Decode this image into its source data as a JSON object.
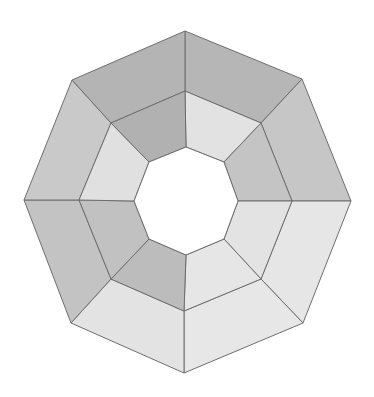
{
  "diagram": {
    "title": "",
    "shape": "segmented-octagonal-ring",
    "rings": 2,
    "segments_per_ring": 8,
    "stroke_color": "#6e6e6e",
    "background": "#ffffff",
    "vertices": {
      "outer": [
        [
          185,
          31
        ],
        [
          302,
          79
        ],
        [
          351,
          201
        ],
        [
          303,
          323
        ],
        [
          184,
          373
        ],
        [
          71,
          323
        ],
        [
          24,
          200
        ],
        [
          72,
          80
        ]
      ],
      "middle": [
        [
          185,
          91
        ],
        [
          261,
          123
        ],
        [
          292,
          201
        ],
        [
          261,
          279
        ],
        [
          184,
          311
        ],
        [
          111,
          279
        ],
        [
          79,
          200
        ],
        [
          111,
          123
        ]
      ],
      "inner": [
        [
          186,
          147
        ],
        [
          224,
          162
        ],
        [
          238,
          201
        ],
        [
          224,
          239
        ],
        [
          186,
          255
        ],
        [
          149,
          239
        ],
        [
          134,
          201
        ],
        [
          149,
          162
        ]
      ]
    },
    "segments": {
      "outer": [
        {
          "position": "top-right",
          "fill": "#b6b6b6"
        },
        {
          "position": "right-upper",
          "fill": "#c6c6c6"
        },
        {
          "position": "right-lower",
          "fill": "#e6e6e6"
        },
        {
          "position": "bottom-right",
          "fill": "#e7e7e7"
        },
        {
          "position": "bottom-left",
          "fill": "#e3e3e3"
        },
        {
          "position": "left-lower",
          "fill": "#c3c3c3"
        },
        {
          "position": "left-upper",
          "fill": "#c9c9c9"
        },
        {
          "position": "top-left",
          "fill": "#b4b4b4"
        }
      ],
      "inner": [
        {
          "position": "top-right",
          "fill": "#e2e2e2"
        },
        {
          "position": "right-upper",
          "fill": "#c4c4c4"
        },
        {
          "position": "right-lower",
          "fill": "#e3e3e3"
        },
        {
          "position": "bottom-right",
          "fill": "#e6e6e6"
        },
        {
          "position": "bottom-left",
          "fill": "#bcbcbc"
        },
        {
          "position": "left-lower",
          "fill": "#c1c1c1"
        },
        {
          "position": "left-upper",
          "fill": "#e0e0e0"
        },
        {
          "position": "top-left",
          "fill": "#b1b1b1"
        }
      ]
    },
    "center_hole_fill": "#ffffff"
  }
}
